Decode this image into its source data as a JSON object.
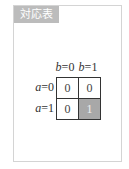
{
  "panel": {
    "label": "対応表"
  },
  "table": {
    "column_headers": [
      {
        "var": "b",
        "eq": "=0"
      },
      {
        "var": "b",
        "eq": "=1"
      }
    ],
    "row_headers": [
      {
        "var": "a",
        "eq": "=0"
      },
      {
        "var": "a",
        "eq": "=1"
      }
    ],
    "cells": [
      [
        "0",
        "0"
      ],
      [
        "0",
        "1"
      ]
    ],
    "highlight_color": "#a8a8a8"
  }
}
